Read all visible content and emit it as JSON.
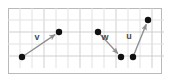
{
  "figure": {
    "background_color": "#ffffff",
    "border_color": "#b9b9b9",
    "grid": {
      "minor_color": "#e2e2e2",
      "major_color": "#cfcfcf",
      "cell_size": 12,
      "columns": 13,
      "rows": 5,
      "origin_x": 8,
      "origin_y": 8
    },
    "style": {
      "dot_color": "#111111",
      "dot_radius": 3.2,
      "arrow_color": "#8e8e8e",
      "label_color": "#4a4a4a"
    }
  },
  "chart_data": {
    "type": "scatter",
    "title": "",
    "xlabel": "",
    "ylabel": "",
    "grid": true,
    "legend": "none",
    "vectors": [
      {
        "name": "v",
        "label": "v",
        "label_x": 37,
        "label_y": 40,
        "tail_x": 22,
        "tail_y": 57,
        "head_x": 59,
        "head_y": 32,
        "components_cells": [
          3,
          2
        ]
      },
      {
        "name": "w",
        "label": "w",
        "label_x": 105,
        "label_y": 40,
        "tail_x": 98,
        "tail_y": 32,
        "head_x": 121,
        "head_y": 57,
        "components_cells": [
          2,
          -2
        ]
      },
      {
        "name": "u",
        "label": "u",
        "label_x": 129,
        "label_y": 39,
        "tail_x": 133,
        "tail_y": 57,
        "head_x": 148,
        "head_y": 20,
        "components_cells": [
          1,
          3
        ]
      }
    ],
    "points": [
      {
        "x": 22,
        "y": 57
      },
      {
        "x": 59,
        "y": 32
      },
      {
        "x": 98,
        "y": 32
      },
      {
        "x": 121,
        "y": 57
      },
      {
        "x": 133,
        "y": 57
      },
      {
        "x": 148,
        "y": 20
      }
    ]
  }
}
